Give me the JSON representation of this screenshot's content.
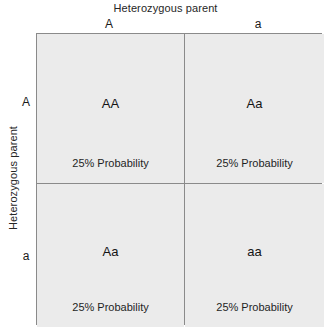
{
  "diagram": {
    "type": "punnett-square",
    "top_axis_title": "Heterozygous parent",
    "left_axis_title": "Heterozygous parent",
    "column_headers": [
      "A",
      "a"
    ],
    "row_headers": [
      "A",
      "a"
    ],
    "cells": [
      {
        "genotype": "AA",
        "probability": "25% Probability"
      },
      {
        "genotype": "Aa",
        "probability": "25% Probability"
      },
      {
        "genotype": "Aa",
        "probability": "25% Probability"
      },
      {
        "genotype": "aa",
        "probability": "25% Probability"
      }
    ],
    "colors": {
      "cell_fill": "#ebebeb",
      "grid_line": "#8a8a8a",
      "text": "#1a1a1a",
      "background": "#ffffff"
    }
  }
}
